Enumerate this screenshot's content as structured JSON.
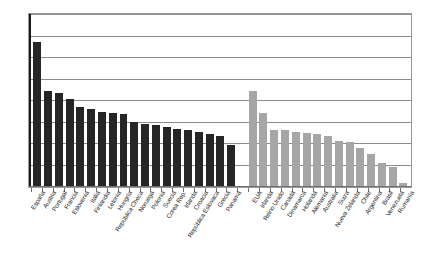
{
  "chart_data": {
    "type": "bar",
    "title": "",
    "subtitle": "",
    "xlabel": "",
    "ylabel": "",
    "ylim": [
      0,
      40
    ],
    "yticks": [
      0,
      5,
      10,
      15,
      20,
      25,
      30,
      35,
      40
    ],
    "grid": true,
    "legend": "none",
    "categories": [
      "España",
      "Austria",
      "Portugal",
      "Francia",
      "Eslovenia",
      "Italia",
      "Finlandia",
      "Letonia",
      "Hungría",
      "República Checa",
      "Noruega",
      "Polonia",
      "Suecia",
      "Corea Rep.",
      "Irlanda",
      "Croacia",
      "República Eslovaca",
      "Grecia",
      "Panamá",
      "",
      "EUA",
      "Irlanda",
      "Reino Unido",
      "Canadá",
      "Dinamarca",
      "Holanda",
      "Alemania",
      "Australia",
      "Suiza",
      "Nueva Zelanda",
      "Chile",
      "Argentina",
      "Brasil",
      "Venezuela",
      "Rumanía"
    ],
    "values": [
      33.8,
      22.2,
      21.8,
      20.4,
      18.5,
      18.0,
      17.3,
      17.1,
      16.8,
      14.9,
      14.5,
      14.2,
      13.8,
      13.4,
      13.0,
      12.6,
      12.2,
      11.8,
      9.6,
      0,
      22.2,
      17.0,
      13.2,
      13.0,
      12.7,
      12.5,
      12.2,
      11.6,
      10.6,
      10.4,
      8.8,
      7.5,
      5.4,
      4.4,
      0.7
    ],
    "series_groups": [
      {
        "name": "grupo-oscuro",
        "color": "#262626",
        "from": 0,
        "to": 18
      },
      {
        "name": "grupo-claro",
        "color": "#a6a6a6",
        "from": 20,
        "to": 34
      }
    ],
    "colors": {
      "dark_bar": "#262626",
      "light_bar": "#a6a6a6",
      "gridline": "#8d8d8d",
      "axis": "#1a1a1a",
      "frame": "#9a9a9a",
      "text": "#1d1d1d",
      "background": "#ffffff"
    }
  }
}
